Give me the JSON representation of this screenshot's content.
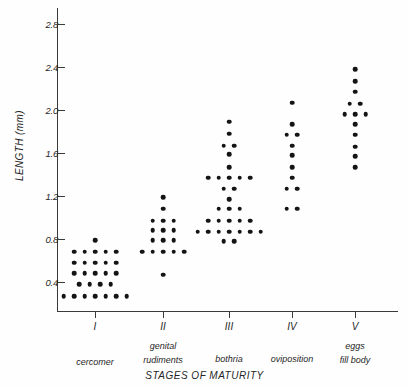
{
  "chart_data": {
    "type": "scatter",
    "title": "",
    "xlabel": "STAGES OF MATURITY",
    "ylabel": "LENGTH (mm)",
    "ylim": [
      0.13,
      2.95
    ],
    "yticks": [
      0.4,
      0.8,
      1.2,
      1.6,
      2.0,
      2.4,
      2.8
    ],
    "ytick_labels": [
      "0.4",
      "0.8",
      "1.2",
      "1.6",
      "2.0",
      "2.4",
      "2.8"
    ],
    "grid": false,
    "legend": null,
    "categories": [
      "I",
      "II",
      "III",
      "IV",
      "V"
    ],
    "category_descriptions": [
      "cercomer",
      "genital rudiments",
      "bothria",
      "oviposition",
      "eggs fill body"
    ],
    "series": [
      {
        "name": "I",
        "stage": "I",
        "description": "cercomer",
        "n": 27,
        "rows": [
          {
            "value": 0.79,
            "count": 1
          },
          {
            "value": 0.68,
            "count": 5
          },
          {
            "value": 0.58,
            "count": 5
          },
          {
            "value": 0.48,
            "count": 5
          },
          {
            "value": 0.38,
            "count": 4
          },
          {
            "value": 0.27,
            "count": 7
          }
        ]
      },
      {
        "name": "II",
        "stage": "II",
        "description": "genital rudiments",
        "n": 17,
        "rows": [
          {
            "value": 1.19,
            "count": 1
          },
          {
            "value": 1.08,
            "count": 1
          },
          {
            "value": 0.97,
            "count": 3
          },
          {
            "value": 0.88,
            "count": 3
          },
          {
            "value": 0.79,
            "count": 3
          },
          {
            "value": 0.68,
            "count": 5
          },
          {
            "value": 0.47,
            "count": 1
          }
        ]
      },
      {
        "name": "III",
        "stage": "III",
        "description": "bothria",
        "n": 37,
        "rows": [
          {
            "value": 1.89,
            "count": 1
          },
          {
            "value": 1.78,
            "count": 1
          },
          {
            "value": 1.67,
            "count": 2
          },
          {
            "value": 1.59,
            "count": 1
          },
          {
            "value": 1.47,
            "count": 1
          },
          {
            "value": 1.37,
            "count": 5
          },
          {
            "value": 1.27,
            "count": 2
          },
          {
            "value": 1.17,
            "count": 1
          },
          {
            "value": 1.08,
            "count": 3
          },
          {
            "value": 0.97,
            "count": 5
          },
          {
            "value": 0.87,
            "count": 7
          },
          {
            "value": 0.78,
            "count": 2
          }
        ]
      },
      {
        "name": "IV",
        "stage": "IV",
        "description": "oviposition",
        "n": 12,
        "rows": [
          {
            "value": 2.07,
            "count": 1
          },
          {
            "value": 1.87,
            "count": 1
          },
          {
            "value": 1.77,
            "count": 2
          },
          {
            "value": 1.67,
            "count": 1
          },
          {
            "value": 1.58,
            "count": 1
          },
          {
            "value": 1.47,
            "count": 1
          },
          {
            "value": 1.37,
            "count": 1
          },
          {
            "value": 1.27,
            "count": 2
          },
          {
            "value": 1.08,
            "count": 2
          }
        ]
      },
      {
        "name": "V",
        "stage": "V",
        "description": "eggs fill body",
        "n": 15,
        "rows": [
          {
            "value": 2.38,
            "count": 1
          },
          {
            "value": 2.27,
            "count": 1
          },
          {
            "value": 2.17,
            "count": 1
          },
          {
            "value": 2.06,
            "count": 2
          },
          {
            "value": 1.96,
            "count": 3
          },
          {
            "value": 1.87,
            "count": 1
          },
          {
            "value": 1.77,
            "count": 1
          },
          {
            "value": 1.66,
            "count": 1
          },
          {
            "value": 1.57,
            "count": 1
          },
          {
            "value": 1.47,
            "count": 1
          }
        ]
      }
    ]
  },
  "axes": {
    "y_title": "LENGTH (mm)",
    "x_title": "STAGES OF MATURITY"
  },
  "x_categories": [
    {
      "roman": "I",
      "desc_line1": "cercomer",
      "desc_line2": ""
    },
    {
      "roman": "II",
      "desc_line1": "genital",
      "desc_line2": "rudiments"
    },
    {
      "roman": "III",
      "desc_line1": "bothria",
      "desc_line2": ""
    },
    {
      "roman": "IV",
      "desc_line1": "oviposition",
      "desc_line2": ""
    },
    {
      "roman": "V",
      "desc_line1": "eggs",
      "desc_line2": "fill body"
    }
  ],
  "colors": {
    "dot": "#141414",
    "axis": "#3a3a3a",
    "text": "#262626",
    "background": "#fefefe"
  }
}
